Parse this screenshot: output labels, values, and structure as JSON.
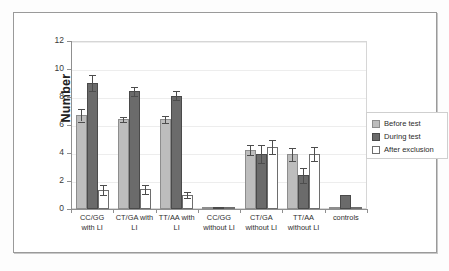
{
  "chart_data": {
    "type": "bar",
    "title": "",
    "xlabel": "",
    "ylabel": "Number",
    "ylim": [
      0,
      12
    ],
    "yticks": [
      0,
      2,
      4,
      6,
      8,
      10,
      12
    ],
    "grid": true,
    "legend_position": "right",
    "categories": [
      "CC/GG with LI",
      "CT/GA with LI",
      "TT/AA with LI",
      "CC/GG without LI",
      "CT/GA without LI",
      "TT/AA without LI",
      "controls"
    ],
    "category_lines": [
      [
        "CC/GG",
        "with LI"
      ],
      [
        "CT/GA with",
        "LI"
      ],
      [
        "TT/AA with",
        "LI"
      ],
      [
        "CC/GG",
        "without LI"
      ],
      [
        "CT/GA",
        "without LI"
      ],
      [
        "TT/AA",
        "without LI"
      ],
      [
        "controls",
        ""
      ]
    ],
    "series": [
      {
        "name": "Before test",
        "color": "#bdbdbd",
        "values": [
          6.7,
          6.4,
          6.4,
          0.05,
          4.2,
          3.9,
          0.05
        ],
        "errors": [
          0.45,
          0.2,
          0.25,
          0.0,
          0.35,
          0.45,
          0.0
        ]
      },
      {
        "name": "During test",
        "color": "#6b6b6b",
        "values": [
          9.0,
          8.4,
          8.1,
          0.05,
          3.95,
          2.4,
          1.0
        ],
        "errors": [
          0.6,
          0.35,
          0.3,
          0.0,
          0.65,
          0.55,
          0.0
        ]
      },
      {
        "name": "After exclusion",
        "color": "#ffffff",
        "values": [
          1.35,
          1.4,
          1.0,
          0.05,
          4.45,
          3.95,
          0.05
        ],
        "errors": [
          0.35,
          0.3,
          0.2,
          0.0,
          0.5,
          0.5,
          0.0
        ]
      }
    ]
  },
  "axis": {
    "y_title": "Number",
    "y_tick_labels": [
      "0",
      "2",
      "4",
      "6",
      "8",
      "10",
      "12"
    ]
  },
  "legend": {
    "items": [
      {
        "label": "Before test"
      },
      {
        "label": "During test"
      },
      {
        "label": "After exclusion"
      }
    ]
  }
}
